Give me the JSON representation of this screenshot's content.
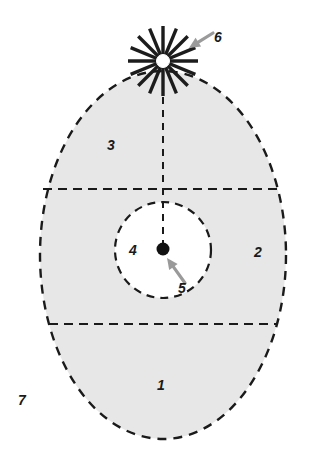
{
  "figure": {
    "background_color": "#ffffff",
    "zone_fill_color": "#e7e7e7",
    "inner_core_fill_color": "#ffffff",
    "outline_color": "#1a1a1a",
    "arrow_color": "#9a9a9a",
    "burst_color": "#1c1c1c",
    "point_color": "#111111"
  },
  "shapes": {
    "outer_ellipse": {
      "name": "outer-dashed-ellipse",
      "cx": 163,
      "cy": 255,
      "rx": 123,
      "ry": 184,
      "dash": "9 7",
      "stroke_width": 2.4
    },
    "inner_circle": {
      "name": "inner-dashed-circle",
      "cx": 163,
      "cy": 250,
      "r": 48,
      "dash": "8 6",
      "stroke_width": 2.2
    },
    "upper_divider": {
      "name": "upper-horizontal-dashed-line",
      "x1": 43,
      "x2": 283,
      "y": 189,
      "dash": "9 6",
      "stroke_width": 2.2
    },
    "lower_divider": {
      "name": "lower-horizontal-dashed-line",
      "x1": 49,
      "x2": 277,
      "y": 324,
      "dash": "9 6",
      "stroke_width": 2.2
    },
    "axis_line": {
      "name": "vertical-axis-dashed-line",
      "x": 163,
      "y1": 97,
      "y2": 243,
      "dash": "7 6",
      "stroke_width": 2.0
    },
    "center_point": {
      "name": "center-point-marker",
      "cx": 163,
      "cy": 249,
      "r": 6.5
    },
    "burst": {
      "name": "starburst-source-marker",
      "cx": 163,
      "cy": 61,
      "rays": 16,
      "ray_length": 35,
      "hub_radius": 6.5,
      "ray_width": 3.4
    },
    "arrow_to_burst": {
      "name": "leader-arrow-to-starburst",
      "from_x": 213,
      "from_y": 33,
      "to_x": 189,
      "to_y": 48
    },
    "arrow_to_point": {
      "name": "leader-arrow-to-center-point",
      "from_x": 185,
      "from_y": 283,
      "to_x": 167,
      "to_y": 258
    }
  },
  "labels": [
    {
      "id": "label-1",
      "name": "zone-label-1",
      "text": "1",
      "x": 161,
      "y": 385
    },
    {
      "id": "label-2",
      "name": "zone-label-2",
      "text": "2",
      "x": 258,
      "y": 252
    },
    {
      "id": "label-3",
      "name": "zone-label-3",
      "text": "3",
      "x": 111,
      "y": 145
    },
    {
      "id": "label-4",
      "name": "zone-label-4",
      "text": "4",
      "x": 133,
      "y": 250
    },
    {
      "id": "label-5",
      "name": "zone-label-5",
      "text": "5",
      "x": 182,
      "y": 288
    },
    {
      "id": "label-6",
      "name": "zone-label-6",
      "text": "6",
      "x": 218,
      "y": 37
    },
    {
      "id": "label-7",
      "name": "zone-label-7",
      "text": "7",
      "x": 22,
      "y": 400
    }
  ]
}
